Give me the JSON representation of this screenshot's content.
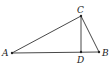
{
  "diagram": {
    "type": "geometry",
    "points": {
      "A": {
        "label": "A",
        "x": 12,
        "y": 53
      },
      "B": {
        "label": "B",
        "x": 99,
        "y": 52
      },
      "C": {
        "label": "C",
        "x": 81,
        "y": 16
      },
      "D": {
        "label": "D",
        "x": 81,
        "y": 52
      }
    },
    "segments": [
      "AB",
      "AC",
      "BC",
      "CD"
    ],
    "line_color": "#333333"
  }
}
